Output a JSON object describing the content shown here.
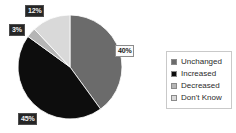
{
  "chart_data": {
    "type": "pie",
    "title": "",
    "categories": [
      "Unchanged",
      "Increased",
      "Decreased",
      "Don't Know"
    ],
    "values": [
      40,
      45,
      3,
      12
    ],
    "value_labels": [
      "40%",
      "45%",
      "3%",
      "12%"
    ],
    "colors": [
      "#6b6b6b",
      "#0d0d0d",
      "#b5b5b5",
      "#d9d9d9"
    ],
    "legend_position": "right",
    "grid": false,
    "start_angle_deg": 0,
    "direction": "clockwise",
    "background": "#ffffff"
  },
  "labels": {
    "unchanged": "40%",
    "increased": "45%",
    "decreased": "3%",
    "dont_know": "12%"
  },
  "legend": {
    "items": [
      {
        "label": "Unchanged",
        "color": "#6b6b6b"
      },
      {
        "label": "Increased",
        "color": "#0d0d0d"
      },
      {
        "label": "Decreased",
        "color": "#b5b5b5"
      },
      {
        "label": "Don't Know",
        "color": "#d9d9d9"
      }
    ]
  }
}
